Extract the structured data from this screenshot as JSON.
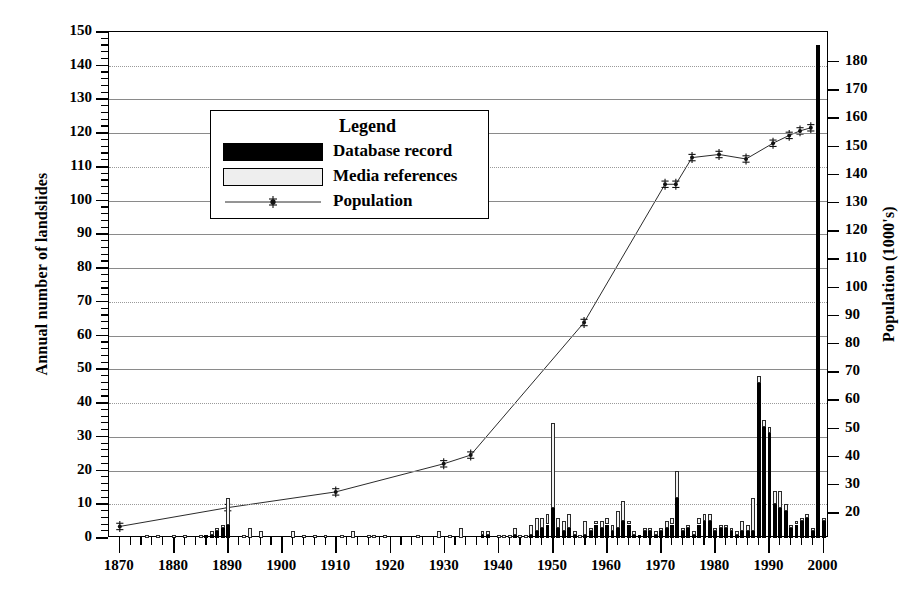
{
  "chart_data": {
    "type": "bar",
    "title": "",
    "xlabel": "",
    "ylabel": "Annual number of landslides",
    "y2label": "Population (1000's)",
    "xlim": [
      1868,
      2001
    ],
    "ylim": [
      0,
      150
    ],
    "y2lim": [
      11.2,
      190.6
    ],
    "grid": true,
    "legend_position": "upper-left-inside",
    "xticks": [
      1870,
      1880,
      1890,
      1900,
      1910,
      1920,
      1930,
      1940,
      1950,
      1960,
      1970,
      1980,
      1990,
      2000
    ],
    "xtick_labels": [
      "1870",
      "1880",
      "1890",
      "1900",
      "1910",
      "1920",
      "1930",
      "1940",
      "1950",
      "1960",
      "1970",
      "1980",
      "1990",
      "2000"
    ],
    "x_minor_tick_step": 2,
    "yticks": [
      0,
      10,
      20,
      30,
      40,
      50,
      60,
      70,
      80,
      90,
      100,
      110,
      120,
      130,
      140,
      150
    ],
    "ytick_labels": [
      "0",
      "10",
      "20",
      "30",
      "40",
      "50",
      "60",
      "70",
      "80",
      "90",
      "100",
      "110",
      "120",
      "130",
      "140",
      "150"
    ],
    "y2ticks": [
      20,
      30,
      40,
      50,
      60,
      70,
      80,
      90,
      100,
      110,
      120,
      130,
      140,
      150,
      160,
      170,
      180
    ],
    "y2tick_labels": [
      "20",
      "30",
      "40",
      "50",
      "60",
      "70",
      "80",
      "90",
      "100",
      "110",
      "120",
      "130",
      "140",
      "150",
      "160",
      "170",
      "180"
    ],
    "series": [
      {
        "name": "Database record",
        "type": "bar-stacked-bottom",
        "color": "#000000",
        "x": [
          1870,
          1871,
          1872,
          1873,
          1874,
          1875,
          1876,
          1877,
          1878,
          1879,
          1880,
          1881,
          1882,
          1883,
          1884,
          1885,
          1886,
          1887,
          1888,
          1889,
          1890,
          1891,
          1892,
          1893,
          1894,
          1895,
          1896,
          1897,
          1898,
          1899,
          1900,
          1901,
          1902,
          1903,
          1904,
          1905,
          1906,
          1907,
          1908,
          1909,
          1910,
          1911,
          1912,
          1913,
          1914,
          1915,
          1916,
          1917,
          1918,
          1919,
          1920,
          1921,
          1922,
          1923,
          1924,
          1925,
          1926,
          1927,
          1928,
          1929,
          1930,
          1931,
          1932,
          1933,
          1934,
          1935,
          1936,
          1937,
          1938,
          1939,
          1940,
          1941,
          1942,
          1943,
          1944,
          1945,
          1946,
          1947,
          1948,
          1949,
          1950,
          1951,
          1952,
          1953,
          1954,
          1955,
          1956,
          1957,
          1958,
          1959,
          1960,
          1961,
          1962,
          1963,
          1964,
          1965,
          1966,
          1967,
          1968,
          1969,
          1970,
          1971,
          1972,
          1973,
          1974,
          1975,
          1976,
          1977,
          1978,
          1979,
          1980,
          1981,
          1982,
          1983,
          1984,
          1985,
          1986,
          1987,
          1988,
          1989,
          1990,
          1991,
          1992,
          1993,
          1994,
          1995,
          1996,
          1997,
          1998,
          1999,
          2000
        ],
        "values": [
          0,
          0,
          0,
          0,
          0,
          0,
          0,
          0,
          0,
          0,
          0,
          0,
          0,
          0,
          0,
          0,
          1,
          1,
          2,
          3,
          4,
          0,
          0,
          0,
          0,
          0,
          0,
          0,
          0,
          0,
          0,
          0,
          0,
          0,
          0,
          0,
          0,
          0,
          0,
          0,
          0,
          0,
          0,
          0,
          0,
          0,
          0,
          0,
          0,
          0,
          0,
          0,
          0,
          0,
          0,
          0,
          0,
          0,
          0,
          0,
          0,
          0,
          0,
          0,
          0,
          0,
          0,
          1,
          1,
          0,
          0,
          0,
          0,
          1,
          0,
          0,
          1,
          2,
          3,
          4,
          9,
          3,
          2,
          3,
          1,
          0,
          1,
          2,
          4,
          3,
          4,
          2,
          3,
          5,
          4,
          1,
          1,
          2,
          2,
          1,
          2,
          3,
          4,
          12,
          2,
          3,
          1,
          4,
          5,
          5,
          2,
          3,
          3,
          2,
          1,
          2,
          2,
          2,
          46,
          33,
          31,
          10,
          9,
          8,
          3,
          4,
          5,
          6,
          2,
          146,
          5
        ]
      },
      {
        "name": "Media references",
        "type": "bar-stacked-top",
        "color": "#f2f2f2",
        "x": [
          1870,
          1871,
          1872,
          1873,
          1874,
          1875,
          1876,
          1877,
          1878,
          1879,
          1880,
          1881,
          1882,
          1883,
          1884,
          1885,
          1886,
          1887,
          1888,
          1889,
          1890,
          1891,
          1892,
          1893,
          1894,
          1895,
          1896,
          1897,
          1898,
          1899,
          1900,
          1901,
          1902,
          1903,
          1904,
          1905,
          1906,
          1907,
          1908,
          1909,
          1910,
          1911,
          1912,
          1913,
          1914,
          1915,
          1916,
          1917,
          1918,
          1919,
          1920,
          1921,
          1922,
          1923,
          1924,
          1925,
          1926,
          1927,
          1928,
          1929,
          1930,
          1931,
          1932,
          1933,
          1934,
          1935,
          1936,
          1937,
          1938,
          1939,
          1940,
          1941,
          1942,
          1943,
          1944,
          1945,
          1946,
          1947,
          1948,
          1949,
          1950,
          1951,
          1952,
          1953,
          1954,
          1955,
          1956,
          1957,
          1958,
          1959,
          1960,
          1961,
          1962,
          1963,
          1964,
          1965,
          1966,
          1967,
          1968,
          1969,
          1970,
          1971,
          1972,
          1973,
          1974,
          1975,
          1976,
          1977,
          1978,
          1979,
          1980,
          1981,
          1982,
          1983,
          1984,
          1985,
          1986,
          1987,
          1988,
          1989,
          1990,
          1991,
          1992,
          1993,
          1994,
          1995,
          1996,
          1997,
          1998,
          1999,
          2000
        ],
        "values": [
          0,
          0,
          0,
          0,
          0,
          1,
          0,
          1,
          0,
          0,
          1,
          0,
          1,
          0,
          0,
          1,
          0,
          1,
          1,
          1,
          8,
          0,
          0,
          1,
          3,
          0,
          2,
          0,
          0,
          0,
          0,
          0,
          2,
          0,
          1,
          0,
          1,
          0,
          1,
          0,
          0,
          1,
          0,
          2,
          0,
          0,
          1,
          1,
          0,
          1,
          0,
          0,
          0,
          0,
          0,
          1,
          0,
          0,
          0,
          2,
          0,
          1,
          0,
          3,
          0,
          0,
          0,
          1,
          1,
          0,
          1,
          1,
          1,
          2,
          1,
          1,
          3,
          4,
          3,
          3,
          25,
          3,
          3,
          4,
          1,
          1,
          4,
          1,
          1,
          2,
          2,
          2,
          5,
          6,
          1,
          1,
          0,
          1,
          1,
          1,
          1,
          2,
          2,
          8,
          1,
          1,
          1,
          2,
          2,
          2,
          1,
          1,
          1,
          1,
          1,
          3,
          2,
          10,
          2,
          2,
          2,
          4,
          5,
          2,
          1,
          1,
          1,
          1,
          1,
          0,
          1
        ]
      },
      {
        "name": "Population",
        "type": "line",
        "axis": "right",
        "color": "#2a2a2a",
        "marker": "census-marker",
        "x": [
          1870,
          1890,
          1910,
          1930,
          1935,
          1956,
          1971,
          1973,
          1976,
          1981,
          1986,
          1991,
          1994,
          1996,
          1998
        ],
        "values_left_scale": [
          2.5,
          7.5,
          12.5,
          23.5,
          27.0,
          74.0,
          128.0,
          128.0,
          136.5,
          137.5,
          136.0,
          141.0,
          143.5,
          145.0,
          146.0
        ],
        "values": [
          14.6,
          21.3,
          26.9,
          36.9,
          40.0,
          87.2,
          136.4,
          136.4,
          145.9,
          147.0,
          145.4,
          151.0,
          153.8,
          155.4,
          156.5
        ]
      }
    ]
  },
  "axes": {
    "left_title": "Annual number of landslides",
    "right_title": "Population (1000's)"
  },
  "legend": {
    "title": "Legend",
    "items": [
      {
        "label": "Database record",
        "swatch": "solid-black"
      },
      {
        "label": "Media references",
        "swatch": "outline-white"
      },
      {
        "label": "Population",
        "swatch": "line-marker"
      }
    ]
  }
}
